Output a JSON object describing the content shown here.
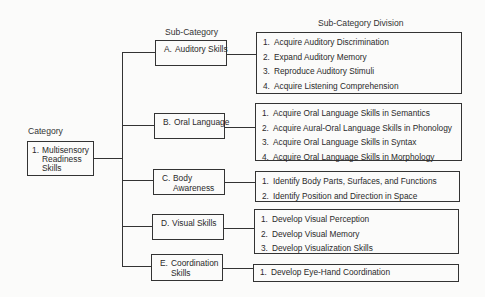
{
  "headers": {
    "category": "Category",
    "sub_category": "Sub-Category",
    "division": "Sub-Category Division"
  },
  "category": {
    "number": "1.",
    "label_lines": [
      "Multisensory",
      "Readiness",
      "Skills"
    ]
  },
  "sub_categories": [
    {
      "letter": "A.",
      "label": "Auditory Skills",
      "divisions": [
        {
          "n": "1.",
          "text": "Acquire Auditory Discrimination"
        },
        {
          "n": "2.",
          "text": "Expand Auditory Memory"
        },
        {
          "n": "3.",
          "text": "Reproduce Auditory Stimuli"
        },
        {
          "n": "4.",
          "text": "Acquire Listening Comprehension"
        }
      ]
    },
    {
      "letter": "B.",
      "label": "Oral Language",
      "divisions": [
        {
          "n": "1.",
          "text": "Acquire Oral Language Skills in Semantics"
        },
        {
          "n": "2.",
          "text": "Acquire Aural-Oral Language Skills in Phonology"
        },
        {
          "n": "3.",
          "text": "Acquire Oral Language Skills in Syntax"
        },
        {
          "n": "4.",
          "text": "Acquire Oral Language Skills in Morphology"
        }
      ]
    },
    {
      "letter": "C.",
      "label": "Body Awareness",
      "divisions": [
        {
          "n": "1.",
          "text": "Identify Body Parts, Surfaces, and Functions"
        },
        {
          "n": "2.",
          "text": "Identify Position and Direction in Space"
        }
      ]
    },
    {
      "letter": "D.",
      "label": "Visual Skills",
      "divisions": [
        {
          "n": "1.",
          "text": "Develop Visual Perception"
        },
        {
          "n": "2.",
          "text": "Develop Visual Memory"
        },
        {
          "n": "3.",
          "text": "Develop Visualization Skills"
        }
      ]
    },
    {
      "letter": "E.",
      "label": "Coordination Skills",
      "divisions": [
        {
          "n": "1.",
          "text": "Develop Eye-Hand Coordination"
        }
      ]
    }
  ]
}
